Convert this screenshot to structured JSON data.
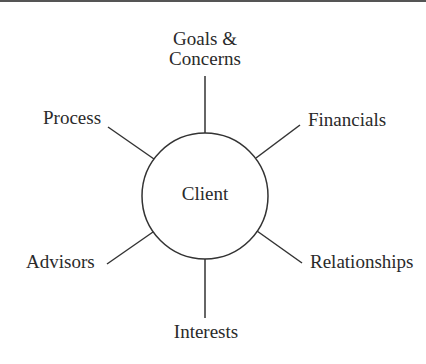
{
  "diagram": {
    "type": "hub-and-spoke",
    "center": {
      "label": "Client"
    },
    "nodes": [
      {
        "id": "goals",
        "label_lines": [
          "Goals &",
          "Concerns"
        ],
        "position": "top"
      },
      {
        "id": "financials",
        "label": "Financials",
        "position": "upper-right"
      },
      {
        "id": "relationships",
        "label": "Relationships",
        "position": "lower-right"
      },
      {
        "id": "interests",
        "label": "Interests",
        "position": "bottom"
      },
      {
        "id": "advisors",
        "label": "Advisors",
        "position": "lower-left"
      },
      {
        "id": "process",
        "label": "Process",
        "position": "upper-left"
      }
    ],
    "colors": {
      "stroke": "#333333",
      "text": "#2a2a2a",
      "background": "#ffffff",
      "top_rule": "#555555"
    }
  }
}
